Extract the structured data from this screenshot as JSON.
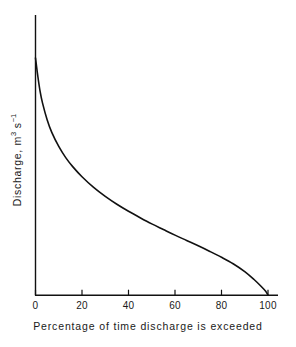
{
  "chart_data": {
    "type": "line",
    "title": "",
    "subtitle": "",
    "xlabel": "Percentage of time discharge is exceeded",
    "ylabel_text": "Discharge, m",
    "ylabel_sup1": "3",
    "ylabel_mid": " s",
    "ylabel_sup2": "−1",
    "ylabel_full": "Discharge, m3 s-1",
    "xlim": [
      0,
      100
    ],
    "ylim": [
      0,
      100
    ],
    "grid": false,
    "legend": "none",
    "xticks": [
      0,
      20,
      40,
      60,
      80,
      100
    ],
    "xtick_labels": [
      "0",
      "20",
      "40",
      "60",
      "80",
      "100"
    ],
    "yticks": [],
    "ytick_labels": [],
    "series": [
      {
        "name": "Flow duration curve",
        "color": "#111111",
        "x": [
          0,
          1,
          2,
          3,
          5,
          7,
          10,
          13,
          16,
          20,
          25,
          30,
          35,
          40,
          45,
          50,
          55,
          60,
          65,
          70,
          75,
          80,
          85,
          90,
          94,
          97,
          99,
          100
        ],
        "values": [
          84.5,
          78.0,
          72.5,
          68.5,
          62.5,
          58.0,
          53.0,
          49.0,
          45.8,
          42.2,
          38.4,
          35.2,
          32.4,
          29.9,
          27.6,
          25.4,
          23.4,
          21.4,
          19.5,
          17.6,
          15.6,
          13.5,
          11.2,
          8.4,
          5.6,
          3.2,
          1.4,
          0.0
        ]
      }
    ]
  },
  "axes": {
    "x_axis_name": "percentage-axis",
    "y_axis_name": "discharge-axis",
    "tick_direction": "inward"
  },
  "colors": {
    "background": "#ffffff",
    "axis": "#111111",
    "curve": "#111111",
    "text": "#1a1a1a"
  }
}
